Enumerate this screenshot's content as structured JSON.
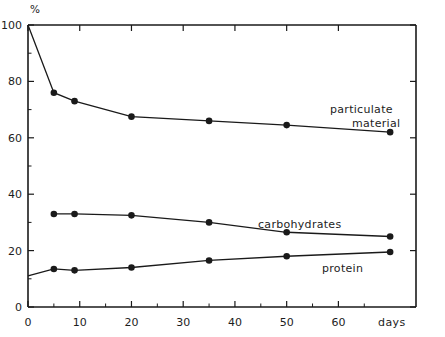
{
  "chart_data": {
    "type": "line",
    "title": "",
    "subtitle": "",
    "xlabel": "days",
    "ylabel": "%",
    "unit_label": "%",
    "xlim": [
      0,
      75
    ],
    "ylim": [
      0,
      100
    ],
    "grid": false,
    "legend_position": "inline-annotations",
    "x_ticks": [
      0,
      10,
      20,
      30,
      40,
      50,
      60
    ],
    "x_tick_labels": [
      "0",
      "10",
      "20",
      "30",
      "40",
      "50",
      "60"
    ],
    "x_minor_ticks": [
      5,
      15,
      25,
      35,
      45,
      55,
      65
    ],
    "y_ticks": [
      0,
      20,
      40,
      60,
      80,
      100
    ],
    "y_tick_labels": [
      "0",
      "20",
      "40",
      "60",
      "80",
      "100"
    ],
    "y_minor_ticks": [
      10,
      30,
      50,
      70,
      90
    ],
    "marker": "filled-circle",
    "series": [
      {
        "name": "particulate material",
        "label": "particulate material",
        "label_lines": [
          "particulate",
          "material"
        ],
        "color": "#1a1a1a",
        "x": [
          0,
          5,
          9,
          20,
          35,
          50,
          70
        ],
        "values": [
          100,
          76,
          73,
          67.5,
          66,
          64.5,
          62
        ]
      },
      {
        "name": "carbohydrates",
        "label": "carbohydrates",
        "label_lines": [
          "carbohydrates"
        ],
        "color": "#1a1a1a",
        "x": [
          5,
          9,
          20,
          35,
          50,
          70
        ],
        "values": [
          33,
          33,
          32.5,
          30,
          26.5,
          25
        ]
      },
      {
        "name": "protein",
        "label": "protein",
        "label_lines": [
          "protein"
        ],
        "color": "#1a1a1a",
        "x": [
          0,
          5,
          9,
          20,
          35,
          50,
          70
        ],
        "values": [
          11,
          13.5,
          13,
          14,
          16.5,
          18,
          19.5
        ]
      }
    ]
  },
  "axes": {
    "y_unit": "%",
    "x_title": "days"
  },
  "annotations": {
    "particulate_line1": "particulate",
    "particulate_line2": "material",
    "carbohydrates": "carbohydrates",
    "protein": "protein"
  },
  "ticks": {
    "y": [
      "100",
      "80",
      "60",
      "40",
      "20",
      "0"
    ],
    "x": [
      "0",
      "10",
      "20",
      "30",
      "40",
      "50",
      "60"
    ]
  }
}
